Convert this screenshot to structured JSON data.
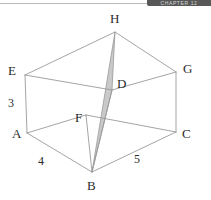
{
  "header": {
    "banner_text": "CHAPTER 12"
  },
  "figure": {
    "shape_name": "cuboid",
    "shaded_region": "triangle H-B-D",
    "colors": {
      "edge_line": "#9a9a9a",
      "shade_fill": "#c9c9c9",
      "shade_stroke": "#8f8f8f",
      "label_text": "#2b2b2b",
      "banner_bg": "#585858",
      "background": "#ffffff"
    },
    "vertices": [
      {
        "id": "H",
        "label": "H",
        "x": 115,
        "y": 32,
        "label_x": 110,
        "label_y": 12
      },
      {
        "id": "E",
        "label": "E",
        "x": 25,
        "y": 75,
        "label_x": 8,
        "label_y": 64
      },
      {
        "id": "G",
        "label": "G",
        "x": 176,
        "y": 72,
        "label_x": 183,
        "label_y": 62
      },
      {
        "id": "D",
        "label": "D",
        "x": 112,
        "y": 90,
        "label_x": 117,
        "label_y": 77
      },
      {
        "id": "F",
        "label": "F",
        "x": 86,
        "y": 115,
        "label_x": 75,
        "label_y": 111
      },
      {
        "id": "A",
        "label": "A",
        "x": 27,
        "y": 133,
        "label_x": 12,
        "label_y": 127
      },
      {
        "id": "C",
        "label": "C",
        "x": 176,
        "y": 132,
        "label_x": 182,
        "label_y": 127
      },
      {
        "id": "B",
        "label": "B",
        "x": 92,
        "y": 172,
        "label_x": 87,
        "label_y": 179
      }
    ],
    "edges": [
      {
        "from": "E",
        "to": "H"
      },
      {
        "from": "H",
        "to": "G"
      },
      {
        "from": "G",
        "to": "D"
      },
      {
        "from": "D",
        "to": "E"
      },
      {
        "from": "A",
        "to": "B"
      },
      {
        "from": "B",
        "to": "C"
      },
      {
        "from": "C",
        "to": "F"
      },
      {
        "from": "F",
        "to": "A"
      },
      {
        "from": "E",
        "to": "A"
      },
      {
        "from": "G",
        "to": "C"
      },
      {
        "from": "D",
        "to": "B"
      },
      {
        "from": "F",
        "to": "B"
      }
    ],
    "shaded_triangle": [
      "H",
      "D",
      "B"
    ],
    "edge_labels": [
      {
        "id": "height",
        "value": "3",
        "x": 8,
        "y": 97
      },
      {
        "id": "width",
        "value": "4",
        "x": 38,
        "y": 155
      },
      {
        "id": "length",
        "value": "5",
        "x": 134,
        "y": 153
      }
    ]
  }
}
